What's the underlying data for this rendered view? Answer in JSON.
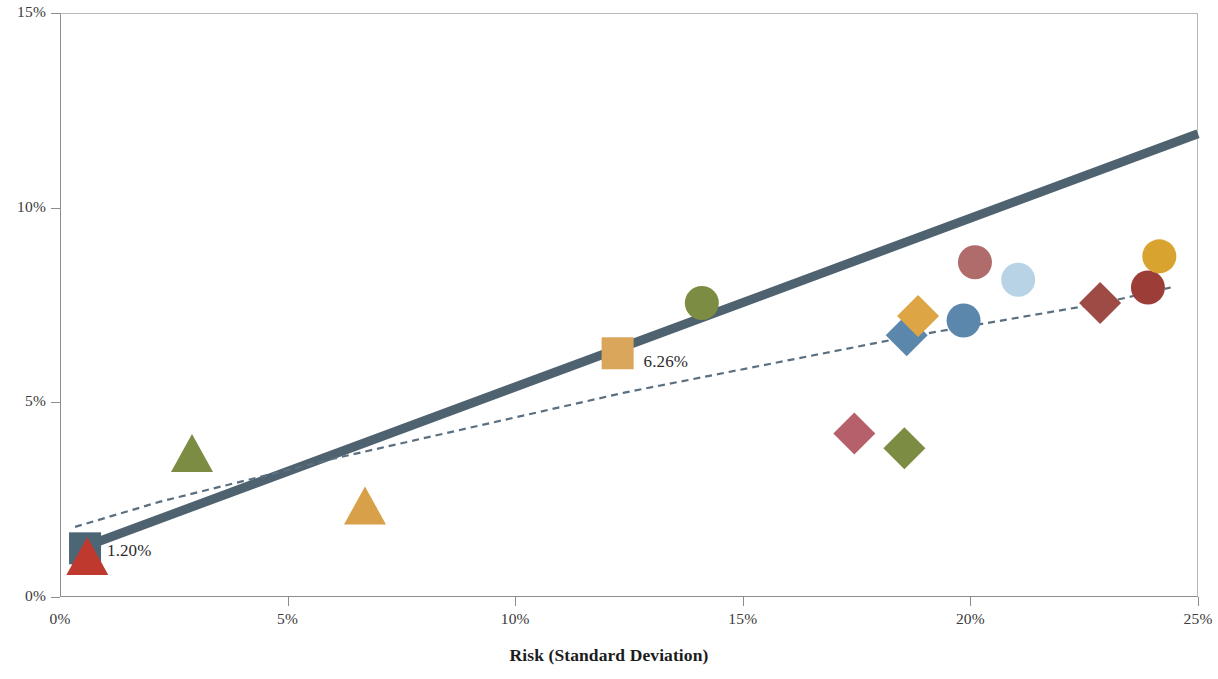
{
  "chart_data": {
    "type": "scatter",
    "title": "",
    "xlabel": "Risk (Standard Deviation)",
    "ylabel": "",
    "xlim": [
      0,
      25
    ],
    "ylim": [
      0,
      15
    ],
    "xticks": [
      "0%",
      "5%",
      "10%",
      "15%",
      "20%",
      "25%"
    ],
    "xtick_values": [
      0,
      5,
      10,
      15,
      20,
      25
    ],
    "yticks": [
      "0%",
      "5%",
      "10%",
      "15%"
    ],
    "ytick_values": [
      0,
      5,
      10,
      15
    ],
    "grid": false,
    "legend": "none",
    "axis_unit": "percent",
    "points": [
      {
        "name": "origin-square",
        "shape": "square",
        "x": 0.55,
        "y": 1.25,
        "color": "#4d6675",
        "label": "1.20%",
        "label_dx": 22,
        "label_dy": 2
      },
      {
        "name": "origin-triangle",
        "shape": "triangle",
        "x": 0.6,
        "y": 1.05,
        "color": "#c0392f",
        "label": "",
        "label_dx": 0,
        "label_dy": 0
      },
      {
        "name": "green-triangle-low",
        "shape": "triangle",
        "x": 2.9,
        "y": 3.7,
        "color": "#7d8c43",
        "label": "",
        "label_dx": 0,
        "label_dy": 0
      },
      {
        "name": "orange-triangle-low",
        "shape": "triangle",
        "x": 6.7,
        "y": 2.35,
        "color": "#d9a04a",
        "label": "",
        "label_dx": 0,
        "label_dy": 0
      },
      {
        "name": "orange-square-mid",
        "shape": "square",
        "x": 12.25,
        "y": 6.26,
        "color": "#d9a65c",
        "label": "6.26%",
        "label_dx": 26,
        "label_dy": 8
      },
      {
        "name": "green-circle-mid",
        "shape": "circle",
        "x": 14.1,
        "y": 7.55,
        "color": "#7d8c43",
        "label": "",
        "label_dx": 0,
        "label_dy": 0
      },
      {
        "name": "red-diamond-low",
        "shape": "diamond",
        "x": 17.45,
        "y": 4.2,
        "color": "#b5606a",
        "label": "",
        "label_dx": 0,
        "label_dy": 0
      },
      {
        "name": "green-diamond-low",
        "shape": "diamond",
        "x": 18.55,
        "y": 3.82,
        "color": "#7d8c43",
        "label": "",
        "label_dx": 0,
        "label_dy": 0
      },
      {
        "name": "blue-diamond",
        "shape": "diamond",
        "x": 18.6,
        "y": 6.72,
        "color": "#5b87ad",
        "label": "",
        "label_dx": 0,
        "label_dy": 0
      },
      {
        "name": "gold-diamond",
        "shape": "diamond",
        "x": 18.85,
        "y": 7.22,
        "color": "#dda543",
        "label": "",
        "label_dx": 0,
        "label_dy": 0
      },
      {
        "name": "red-circle-upper",
        "shape": "circle",
        "x": 20.1,
        "y": 8.6,
        "color": "#b06b6b",
        "label": "",
        "label_dx": 0,
        "label_dy": 0
      },
      {
        "name": "blue-circle",
        "shape": "circle",
        "x": 19.85,
        "y": 7.1,
        "color": "#5b87ad",
        "label": "",
        "label_dx": 0,
        "label_dy": 0
      },
      {
        "name": "lightblue-circle",
        "shape": "circle",
        "x": 21.05,
        "y": 8.15,
        "color": "#b9d3e6",
        "label": "",
        "label_dx": 0,
        "label_dy": 0
      },
      {
        "name": "darkred-diamond",
        "shape": "diamond",
        "x": 22.85,
        "y": 7.55,
        "color": "#9e4a45",
        "label": "",
        "label_dx": 0,
        "label_dy": 0
      },
      {
        "name": "darkred-circle",
        "shape": "circle",
        "x": 23.9,
        "y": 7.95,
        "color": "#9c3d38",
        "label": "",
        "label_dx": 0,
        "label_dy": 0
      },
      {
        "name": "orange-circle-top",
        "shape": "circle",
        "x": 24.15,
        "y": 8.75,
        "color": "#d9a32f",
        "label": "",
        "label_dx": 0,
        "label_dy": 0
      }
    ],
    "lines": [
      {
        "name": "capital-market-line",
        "style": "solid",
        "color": "#4f6270",
        "width": 9,
        "x0": 0.33,
        "y0": 1.2,
        "x1": 25.0,
        "y1": 11.9
      },
      {
        "name": "efficient-frontier-dashed",
        "style": "dashed",
        "color": "#5a6f80",
        "width": 2.2,
        "dash": "7 5",
        "points": [
          {
            "x": 0.33,
            "y": 1.8
          },
          {
            "x": 2.2,
            "y": 2.45
          },
          {
            "x": 6.0,
            "y": 3.55
          },
          {
            "x": 12.4,
            "y": 5.25
          },
          {
            "x": 18.6,
            "y": 6.68
          },
          {
            "x": 22.9,
            "y": 7.55
          },
          {
            "x": 24.4,
            "y": 7.95
          }
        ]
      }
    ]
  },
  "axes": {
    "x_title": "Risk (Standard Deviation)"
  }
}
